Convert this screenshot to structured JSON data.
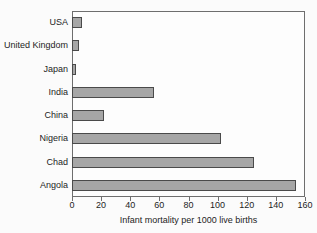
{
  "chart_data": {
    "type": "bar",
    "orientation": "horizontal",
    "title": "",
    "xlabel": "Infant mortality per 1000 live births",
    "ylabel": "",
    "categories": [
      "USA",
      "United Kingdom",
      "Japan",
      "India",
      "China",
      "Nigeria",
      "Chad",
      "Angola"
    ],
    "values": [
      7,
      5,
      3,
      56,
      22,
      102,
      125,
      154
    ],
    "xlim": [
      0,
      160
    ],
    "xticks": [
      0,
      20,
      40,
      60,
      80,
      100,
      120,
      140,
      160
    ],
    "xtick_labels": [
      "0",
      "20",
      "40",
      "60",
      "80",
      "100",
      "120",
      "140",
      "160"
    ],
    "grid": false,
    "legend": null,
    "bar_color": "#a6a6a6",
    "bar_edge_color": "#4a4a4a",
    "frame_color": "#6e6e6e",
    "background_color": "#fdfdfd"
  }
}
